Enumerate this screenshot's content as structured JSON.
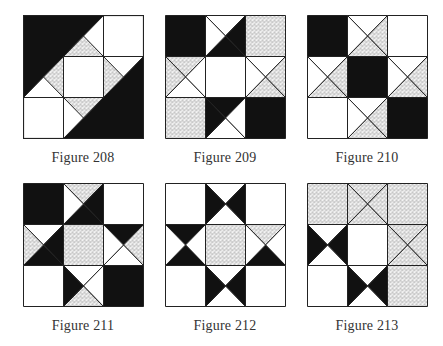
{
  "colors": {
    "black": "#111111",
    "white": "#ffffff",
    "stipple_bg": "#f2f2f2",
    "stipple_dot": "#222222",
    "line": "#222222"
  },
  "figures": [
    {
      "caption": "Figure 208",
      "x": 23,
      "y": 15,
      "cx": 13,
      "cy": 150,
      "cells": [
        {
          "type": "solid",
          "fill": "black"
        },
        {
          "type": "diag_bltr",
          "ul": "black",
          "lr": "white"
        },
        {
          "type": "solid",
          "fill": "white"
        },
        {
          "type": "diag_bltr",
          "ul": "black",
          "lr": "white",
          "split_ul": true,
          "ul_top": "stipple",
          "ul_left": "black"
        },
        {
          "type": "solid",
          "fill": "white"
        },
        {
          "type": "diag_bltr",
          "ul": "stipple",
          "lr": "black",
          "split_ul": false
        },
        {
          "type": "solid",
          "fill": "white"
        },
        {
          "type": "diag_bltr",
          "ul": "white",
          "lr": "black"
        },
        {
          "type": "solid",
          "fill": "black"
        }
      ]
    },
    {
      "caption": "Figure 209",
      "x": 165,
      "y": 15,
      "cx": 155,
      "cy": 150,
      "cells": [
        {
          "type": "solid",
          "fill": "black"
        },
        {
          "type": "x",
          "t": "white",
          "r": "black",
          "b": "black",
          "l": "white"
        },
        {
          "type": "solid",
          "fill": "stipple"
        },
        {
          "type": "x",
          "t": "stipple",
          "r": "white",
          "b": "white",
          "l": "stipple"
        },
        {
          "type": "solid",
          "fill": "white"
        },
        {
          "type": "x",
          "t": "white",
          "r": "stipple",
          "b": "stipple",
          "l": "white"
        },
        {
          "type": "solid",
          "fill": "stipple"
        },
        {
          "type": "x",
          "t": "black",
          "r": "white",
          "b": "white",
          "l": "black"
        },
        {
          "type": "solid",
          "fill": "black"
        }
      ]
    },
    {
      "caption": "Figure 210",
      "x": 307,
      "y": 15,
      "cx": 297,
      "cy": 150,
      "cells": [
        {
          "type": "solid",
          "fill": "black"
        },
        {
          "type": "x",
          "t": "white",
          "r": "stipple",
          "b": "stipple",
          "l": "white"
        },
        {
          "type": "solid",
          "fill": "white"
        },
        {
          "type": "x",
          "t": "white",
          "r": "stipple",
          "b": "stipple",
          "l": "white"
        },
        {
          "type": "solid",
          "fill": "black"
        },
        {
          "type": "x",
          "t": "white",
          "r": "stipple",
          "b": "stipple",
          "l": "white"
        },
        {
          "type": "solid",
          "fill": "white"
        },
        {
          "type": "x",
          "t": "white",
          "r": "stipple",
          "b": "stipple",
          "l": "white"
        },
        {
          "type": "solid",
          "fill": "black"
        }
      ]
    },
    {
      "caption": "Figure 211",
      "x": 23,
      "y": 183,
      "cx": 13,
      "cy": 318,
      "cells": [
        {
          "type": "solid",
          "fill": "black"
        },
        {
          "type": "x",
          "t": "stipple",
          "r": "black",
          "b": "black",
          "l": "white"
        },
        {
          "type": "solid",
          "fill": "white"
        },
        {
          "type": "x",
          "t": "white",
          "r": "black",
          "b": "black",
          "l": "stipple"
        },
        {
          "type": "solid",
          "fill": "stipple"
        },
        {
          "type": "x",
          "t": "black",
          "r": "stipple",
          "b": "white",
          "l": "white"
        },
        {
          "type": "solid",
          "fill": "white"
        },
        {
          "type": "x",
          "t": "white",
          "r": "white",
          "b": "stipple",
          "l": "black"
        },
        {
          "type": "solid",
          "fill": "black"
        }
      ]
    },
    {
      "caption": "Figure 212",
      "x": 165,
      "y": 183,
      "cx": 155,
      "cy": 318,
      "cells": [
        {
          "type": "solid",
          "fill": "white"
        },
        {
          "type": "x",
          "t": "white",
          "r": "black",
          "b": "white",
          "l": "black"
        },
        {
          "type": "solid",
          "fill": "white"
        },
        {
          "type": "x",
          "t": "black",
          "r": "white",
          "b": "black",
          "l": "white"
        },
        {
          "type": "solid",
          "fill": "stipple"
        },
        {
          "type": "x",
          "t": "stipple",
          "r": "white",
          "b": "black",
          "l": "white"
        },
        {
          "type": "solid",
          "fill": "white"
        },
        {
          "type": "x",
          "t": "white",
          "r": "black",
          "b": "white",
          "l": "black"
        },
        {
          "type": "solid",
          "fill": "white"
        }
      ]
    },
    {
      "caption": "Figure 213",
      "x": 307,
      "y": 183,
      "cx": 297,
      "cy": 318,
      "cells": [
        {
          "type": "solid",
          "fill": "stipple"
        },
        {
          "type": "x",
          "t": "stipple",
          "r": "stipple",
          "b": "stipple",
          "l": "stipple"
        },
        {
          "type": "solid",
          "fill": "stipple"
        },
        {
          "type": "x",
          "t": "white",
          "r": "black",
          "b": "white",
          "l": "black"
        },
        {
          "type": "solid",
          "fill": "white"
        },
        {
          "type": "x",
          "t": "stipple",
          "r": "stipple",
          "b": "stipple",
          "l": "stipple"
        },
        {
          "type": "solid",
          "fill": "white"
        },
        {
          "type": "x",
          "t": "white",
          "r": "black",
          "b": "white",
          "l": "black"
        },
        {
          "type": "solid",
          "fill": "stipple"
        }
      ]
    }
  ]
}
